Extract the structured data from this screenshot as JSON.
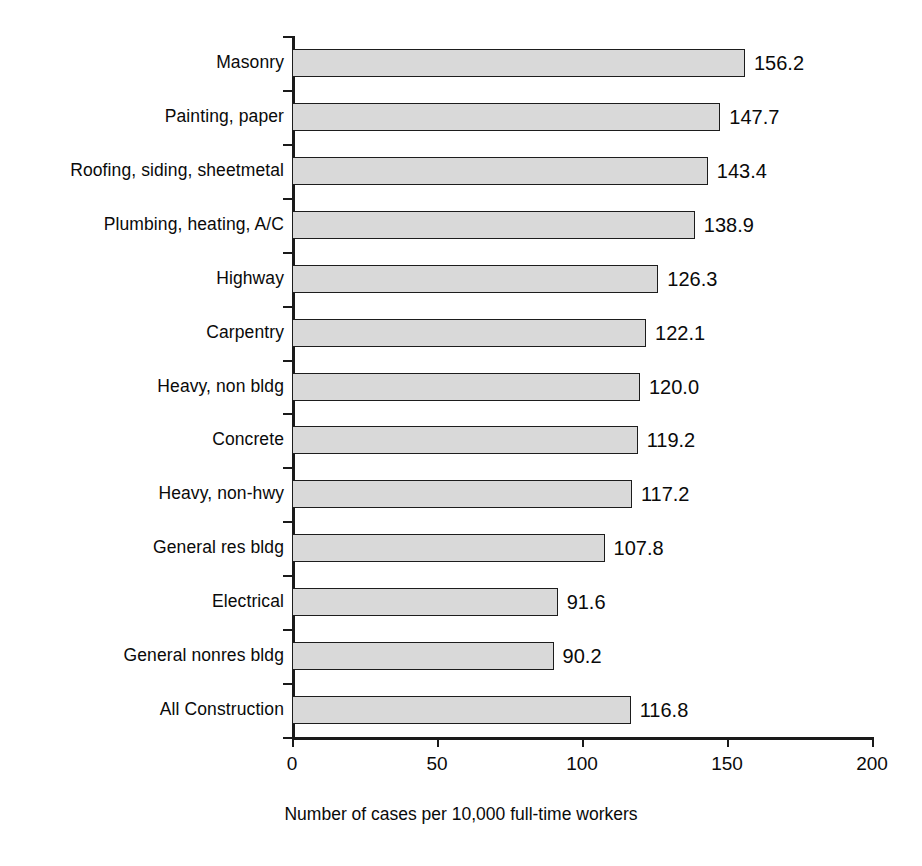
{
  "chart_data": {
    "type": "bar",
    "orientation": "horizontal",
    "title": "",
    "subtitle": "",
    "xlabel": "Number of cases per 10,000 full-time workers",
    "ylabel": "",
    "xlim": [
      0,
      200
    ],
    "xticks": [
      0,
      50,
      100,
      150,
      200
    ],
    "xtick_labels": [
      "0",
      "50",
      "100",
      "150",
      "200"
    ],
    "grid": false,
    "legend": null,
    "categories": [
      "Masonry",
      "Painting, paper",
      "Roofing, siding, sheetmetal",
      "Plumbing, heating, A/C",
      "Highway",
      "Carpentry",
      "Heavy, non bldg",
      "Concrete",
      "Heavy, non-hwy",
      "General res bldg",
      "Electrical",
      "General nonres bldg",
      "All Construction"
    ],
    "values": [
      156.2,
      147.7,
      143.4,
      138.9,
      126.3,
      122.1,
      120.0,
      119.2,
      117.2,
      107.8,
      91.6,
      90.2,
      116.8
    ],
    "value_labels": [
      "156.2",
      "147.7",
      "143.4",
      "138.9",
      "126.3",
      "122.1",
      "120.0",
      "119.2",
      "117.2",
      "107.8",
      "91.6",
      "90.2",
      "116.8"
    ]
  },
  "style": {
    "bar_fill": "#d9d9d9",
    "bar_stroke": "#1d1d1d",
    "axis_color": "#1a1a1a",
    "text_color": "#0a0a0a",
    "background": "#ffffff"
  }
}
